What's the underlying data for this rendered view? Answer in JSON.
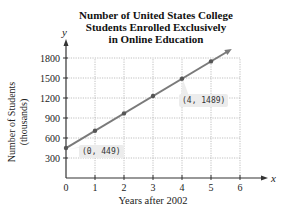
{
  "chart_data": {
    "type": "line",
    "title": "Number of United States College Students Enrolled Exclusively in Online Education",
    "title_lines": [
      "Number of United States College",
      "Students Enrolled Exclusively",
      "in Online Education"
    ],
    "xlabel": "Years after 2002",
    "ylabel": "Number of Students (thousands)",
    "ylabel_lines": [
      "Number of Students",
      "(thousands)"
    ],
    "x_axis_symbol": "x",
    "y_axis_symbol": "y",
    "xlim": [
      0,
      6
    ],
    "ylim": [
      0,
      1800
    ],
    "x_ticks": [
      0,
      1,
      2,
      3,
      4,
      5,
      6
    ],
    "y_ticks": [
      300,
      600,
      900,
      1200,
      1500,
      1800
    ],
    "grid": true,
    "series": [
      {
        "name": "Online-only enrollment (linear model)",
        "x": [
          0,
          1,
          2,
          3,
          4,
          5
        ],
        "values": [
          449,
          709,
          969,
          1229,
          1489,
          1749
        ],
        "color": "#7a7a7a"
      }
    ],
    "annotations": [
      {
        "label": "(0, 449)",
        "x": 0,
        "y": 449
      },
      {
        "label": "(4, 1489)",
        "x": 4,
        "y": 1489
      }
    ]
  },
  "colors": {
    "line": "#7a7a7a",
    "marker": "#555555",
    "grid": "#b0b0b0",
    "axis": "#333333",
    "label_box": "#ececec"
  }
}
